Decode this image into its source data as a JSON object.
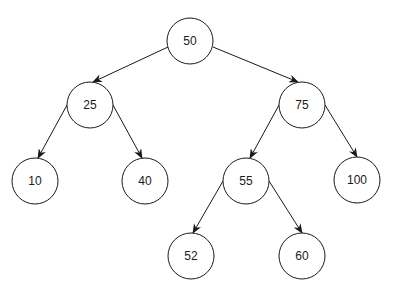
{
  "diagram": {
    "type": "binary-search-tree",
    "nodes": [
      {
        "id": "n50",
        "label": "50",
        "x": 190,
        "y": 41,
        "r": 23
      },
      {
        "id": "n25",
        "label": "25",
        "x": 90,
        "y": 105,
        "r": 23
      },
      {
        "id": "n75",
        "label": "75",
        "x": 302,
        "y": 105,
        "r": 23
      },
      {
        "id": "n10",
        "label": "10",
        "x": 35,
        "y": 181,
        "r": 23
      },
      {
        "id": "n40",
        "label": "40",
        "x": 145,
        "y": 181,
        "r": 23
      },
      {
        "id": "n55",
        "label": "55",
        "x": 246,
        "y": 181,
        "r": 23
      },
      {
        "id": "n100",
        "label": "100",
        "x": 357,
        "y": 180,
        "r": 23
      },
      {
        "id": "n52",
        "label": "52",
        "x": 191,
        "y": 256,
        "r": 23
      },
      {
        "id": "n60",
        "label": "60",
        "x": 302,
        "y": 256,
        "r": 23
      }
    ],
    "edges": [
      {
        "from": "n50",
        "to": "n25",
        "x1": 168,
        "y1": 47,
        "x2": 93,
        "y2": 82
      },
      {
        "from": "n50",
        "to": "n75",
        "x1": 213,
        "y1": 47,
        "x2": 298,
        "y2": 82
      },
      {
        "from": "n25",
        "to": "n10",
        "x1": 67,
        "y1": 105,
        "x2": 38,
        "y2": 158
      },
      {
        "from": "n25",
        "to": "n40",
        "x1": 113,
        "y1": 105,
        "x2": 142,
        "y2": 158
      },
      {
        "from": "n75",
        "to": "n55",
        "x1": 279,
        "y1": 105,
        "x2": 250,
        "y2": 158
      },
      {
        "from": "n75",
        "to": "n100",
        "x1": 325,
        "y1": 105,
        "x2": 357,
        "y2": 157
      },
      {
        "from": "n55",
        "to": "n52",
        "x1": 223,
        "y1": 181,
        "x2": 193,
        "y2": 233
      },
      {
        "from": "n55",
        "to": "n60",
        "x1": 269,
        "y1": 181,
        "x2": 302,
        "y2": 233
      }
    ]
  }
}
